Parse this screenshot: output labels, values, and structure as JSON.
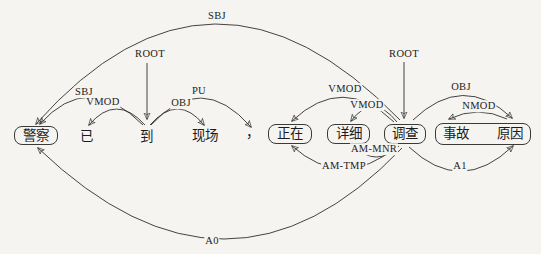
{
  "figure": {
    "type": "dependency-parse-diagram",
    "colors": {
      "background": "#f5f4f1",
      "ink": "#2f2f2f"
    },
    "tokens": {
      "jingcha": {
        "text": "警察",
        "boxed": true
      },
      "yi": {
        "text": "已",
        "boxed": false
      },
      "dao": {
        "text": "到",
        "boxed": false
      },
      "xianchang": {
        "text": "现场",
        "boxed": false
      },
      "comma": {
        "text": "，",
        "boxed": false
      },
      "zhengzai": {
        "text": "正在",
        "boxed": true
      },
      "xiangxi": {
        "text": "详细",
        "boxed": true
      },
      "diaocha": {
        "text": "调查",
        "boxed": true
      },
      "shigu": {
        "text": "事故",
        "boxed": true
      },
      "yuanyin": {
        "text": "原因",
        "boxed": true
      }
    },
    "arcs": {
      "sbj_top": {
        "label": "SBJ",
        "from": "diaocha",
        "to": "jingcha"
      },
      "root_left": {
        "label": "ROOT",
        "from": "root",
        "to": "dao"
      },
      "sbj_left": {
        "label": "SBJ",
        "from": "dao",
        "to": "jingcha"
      },
      "vmod_left": {
        "label": "VMOD",
        "from": "dao",
        "to": "yi"
      },
      "obj_left": {
        "label": "OBJ",
        "from": "dao",
        "to": "xianchang"
      },
      "pu": {
        "label": "PU",
        "from": "dao",
        "to": "comma"
      },
      "root_right": {
        "label": "ROOT",
        "from": "root",
        "to": "diaocha"
      },
      "vmod_zhengzai": {
        "label": "VMOD",
        "from": "diaocha",
        "to": "zhengzai"
      },
      "vmod_xiangxi": {
        "label": "VMOD",
        "from": "diaocha",
        "to": "xiangxi"
      },
      "obj_right": {
        "label": "OBJ",
        "from": "diaocha",
        "to": "yuanyin"
      },
      "nmod": {
        "label": "NMOD",
        "from": "yuanyin",
        "to": "shigu"
      },
      "am_mnr": {
        "label": "AM-MNR",
        "from": "diaocha",
        "to": "xiangxi"
      },
      "am_tmp": {
        "label": "AM-TMP",
        "from": "diaocha",
        "to": "zhengzai"
      },
      "a1": {
        "label": "A1",
        "from": "diaocha",
        "to": "yuanyin"
      },
      "a0": {
        "label": "A0",
        "from": "diaocha",
        "to": "jingcha"
      }
    }
  }
}
